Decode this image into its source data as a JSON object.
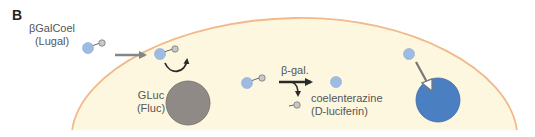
{
  "panel_label": "B",
  "substrate": {
    "name": "βGalCoel",
    "alt_name": "(Lugal)"
  },
  "enzyme": {
    "name": "GLuc",
    "alt_name": "(Fluc)"
  },
  "reaction": {
    "enzyme_label": "β-gal.",
    "product_name": "coelenterazine",
    "product_alt_name": "(D-luciferin)"
  },
  "colors": {
    "cell_fill": "#fdf7e0",
    "cell_membrane": "#f2b98a",
    "substrate_blue": "#9dbbe3",
    "galactose_gray": "#c8c8c8",
    "luciferase_gray": "#8f8a85",
    "luciferase_active_blue": "#4a7fc1",
    "arrow_gray": "#858585",
    "arrow_dark": "#2a2a2a"
  }
}
